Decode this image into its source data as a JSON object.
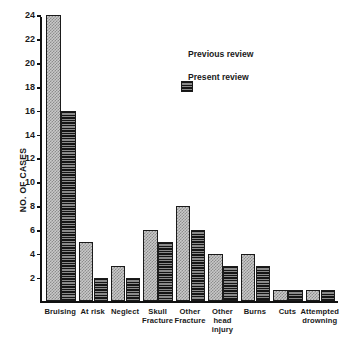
{
  "chart_data": {
    "type": "bar",
    "title": "",
    "xlabel": "",
    "ylabel": "NO. OF CASES",
    "ylim": [
      0,
      24
    ],
    "ytick_step": 2,
    "yticks": [
      2,
      4,
      6,
      8,
      10,
      12,
      14,
      16,
      18,
      20,
      22,
      24
    ],
    "grid": false,
    "legend_position": "upper-center-right",
    "categories": [
      "Bruising",
      "At risk",
      "Neglect",
      "Skull\nFracture",
      "Other\nFracture",
      "Other\nhead\ninjury",
      "Burns",
      "Cuts",
      "Attempted\ndrowning"
    ],
    "series": [
      {
        "name": "Previous review",
        "values": [
          24,
          5,
          3,
          6,
          8,
          4,
          4,
          1,
          1
        ],
        "pattern": "light-checker",
        "color": "#c9c9c9"
      },
      {
        "name": "Present review",
        "values": [
          16,
          2,
          2,
          5,
          6,
          3,
          3,
          1,
          1
        ],
        "pattern": "dark-stripe",
        "color": "#2b2b2b"
      }
    ]
  },
  "legend": {
    "items": [
      {
        "label": "Previous review"
      },
      {
        "label": "Present review"
      }
    ]
  },
  "axis": {
    "y_label": "NO. OF CASES"
  }
}
